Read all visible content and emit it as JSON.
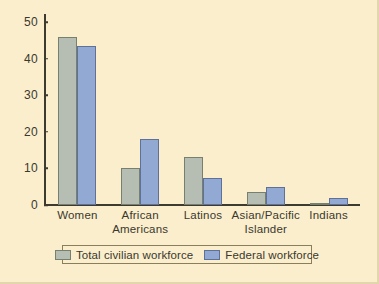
{
  "chart_data": {
    "type": "bar",
    "title": "",
    "subtitle": "",
    "xlabel": "",
    "ylabel": "",
    "ylim": [
      0,
      50
    ],
    "yticks": [
      0,
      10,
      20,
      30,
      40,
      50
    ],
    "grid": false,
    "legend_position": "bottom",
    "categories": [
      "Women",
      "African Americans",
      "Latinos",
      "Asian/Pacific Islander",
      "Indians"
    ],
    "category_lines": [
      [
        "Women"
      ],
      [
        "African",
        "Americans"
      ],
      [
        "Latinos"
      ],
      [
        "Asian/Pacific",
        "Islander"
      ],
      [
        "Indians"
      ]
    ],
    "series": [
      {
        "name": "Total civilian workforce",
        "color": "#b6bdb3",
        "values": [
          46,
          10,
          13,
          3.5,
          0.5
        ]
      },
      {
        "name": "Federal workforce",
        "color": "#92a9d3",
        "values": [
          43.5,
          18,
          7.5,
          5,
          2
        ]
      }
    ]
  },
  "legend": {
    "entries": [
      {
        "label": "Total civilian workforce",
        "swatch": "total"
      },
      {
        "label": "Federal workforce",
        "swatch": "federal"
      }
    ]
  },
  "colors": {
    "background": "#faeecd",
    "axis": "#3d3a30",
    "text": "#3b382e",
    "total_civilian": "#b6bdb3",
    "federal": "#92a9d3"
  }
}
